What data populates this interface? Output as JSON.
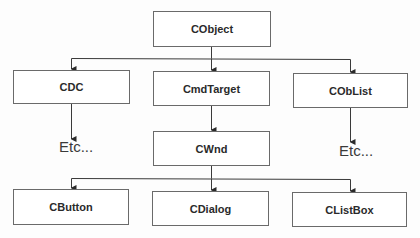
{
  "diagram": {
    "type": "class-hierarchy",
    "nodes": {
      "cobject": "CObject",
      "cdc": "CDC",
      "cmdtarget": "CmdTarget",
      "coblist": "CObList",
      "cwnd": "CWnd",
      "cbutton": "CButton",
      "cdialog": "CDialog",
      "clistbox": "CListBox"
    },
    "etc_labels": {
      "under_cdc": "Etc...",
      "under_coblist": "Etc..."
    },
    "edges": [
      {
        "from": "CObject",
        "to": "CDC"
      },
      {
        "from": "CObject",
        "to": "CmdTarget"
      },
      {
        "from": "CObject",
        "to": "CObList"
      },
      {
        "from": "CDC",
        "to": "Etc..."
      },
      {
        "from": "CmdTarget",
        "to": "CWnd"
      },
      {
        "from": "CObList",
        "to": "Etc..."
      },
      {
        "from": "CWnd",
        "to": "CButton"
      },
      {
        "from": "CWnd",
        "to": "CDialog"
      },
      {
        "from": "CWnd",
        "to": "CListBox"
      }
    ],
    "colors": {
      "line": "#3a3a3a",
      "box_border": "#6a6a6a",
      "text": "#2a2a2a"
    }
  }
}
